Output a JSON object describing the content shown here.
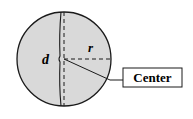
{
  "diagram": {
    "labels": {
      "diameter": "d",
      "radius": "r",
      "center": "Center"
    },
    "colors": {
      "fill": "#d9d9d9",
      "stroke": "#1a1a1a",
      "background": "#ffffff"
    },
    "circle": {
      "cx": 64,
      "cy": 59,
      "r": 47
    }
  }
}
